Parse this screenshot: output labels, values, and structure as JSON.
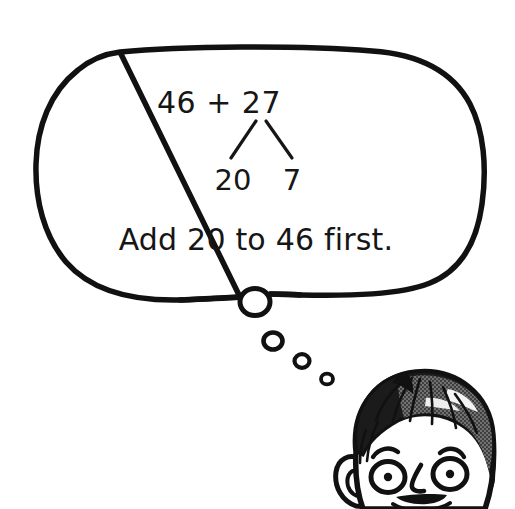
{
  "scene": {
    "title": "Thought bubble with addition strategy",
    "background_color": "#ffffff",
    "ink_color": "#111111",
    "width": 515,
    "height": 509
  },
  "thought_bubble": {
    "name": "thought-bubble",
    "outline_color": "#111111",
    "fill_color": "#ffffff",
    "stroke_width": 5,
    "equation": {
      "text": "46 + 27",
      "addend_left": "46",
      "operator": "+",
      "addend_right": "27"
    },
    "number_bond": {
      "parent": "27",
      "left_part": "20",
      "right_part": "7"
    },
    "instruction": "Add 20 to 46 first.",
    "tail_bubbles": [
      {
        "label": "tail-bubble-1",
        "cx": 255,
        "cy": 302,
        "r": 14
      },
      {
        "label": "tail-bubble-2",
        "cx": 273,
        "cy": 341,
        "r": 9
      },
      {
        "label": "tail-bubble-3",
        "cx": 302,
        "cy": 361,
        "r": 7
      },
      {
        "label": "tail-bubble-4",
        "cx": 327,
        "cy": 379,
        "r": 5.5
      }
    ]
  },
  "character": {
    "name": "boy-thinking",
    "description": "Cartoon boy head looking up",
    "hair_color": "#1a1a1a",
    "hair_shade_color": "#6d6d6d",
    "hair_highlight_color": "#f2f2f2",
    "skin_color": "#ffffff",
    "outline_color": "#111111",
    "features": [
      "hair",
      "left-ear",
      "right-ear",
      "left-eye",
      "right-eye",
      "left-eyebrow",
      "right-eyebrow",
      "nose",
      "mouth"
    ]
  }
}
